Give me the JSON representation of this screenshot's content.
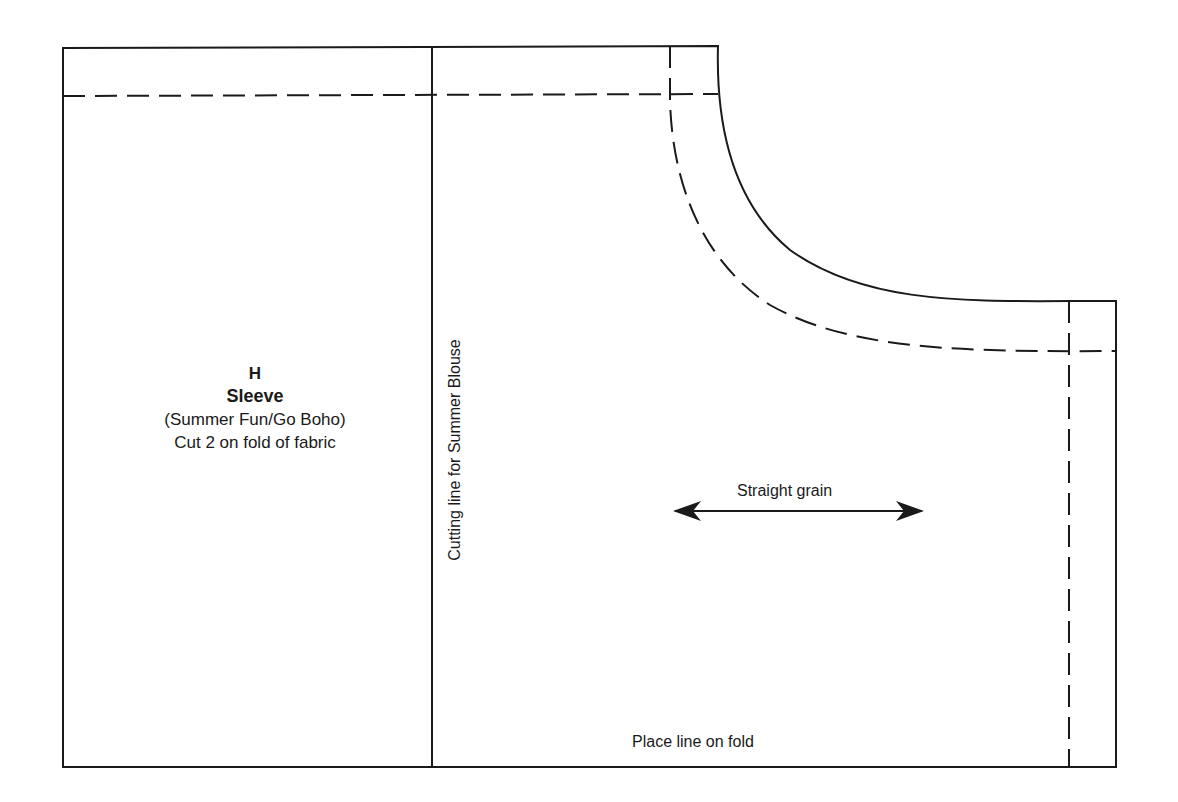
{
  "pattern": {
    "piece_letter": "H",
    "piece_name": "Sleeve",
    "collections": "(Summer Fun/Go Boho)",
    "cut_instruction": "Cut 2 on fold of fabric",
    "cutting_line_label": "Cutting line for Summer Blouse",
    "grain_label": "Straight grain",
    "fold_label": "Place line on fold"
  },
  "colors": {
    "line": "#1a1a1a",
    "background": "#ffffff"
  }
}
